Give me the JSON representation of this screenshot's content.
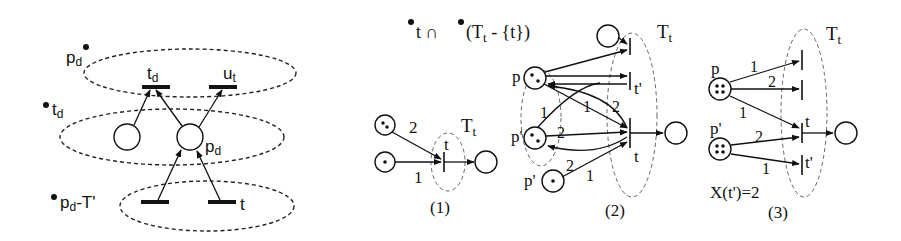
{
  "figure": {
    "left_panel": {
      "set_labels": {
        "pd_post": "p",
        "pd_post_sub": "d",
        "td_pre": "t",
        "td_pre_sub": "d",
        "pd_pre_minus": "p",
        "pd_pre_minus_sub": "d",
        "pd_pre_minus_rest": "-T'"
      },
      "transitions": {
        "td": "t",
        "td_sub": "d",
        "ut": "u",
        "ut_sub": "t",
        "t": "t"
      },
      "places": {
        "pd": "p",
        "pd_sub": "d"
      }
    },
    "header_formula": {
      "part1": "t ∩ ",
      "part2": "(T",
      "part2_sub": "t",
      "part3": " - {t})"
    },
    "panel1": {
      "caption": "(1)",
      "set_label": "T",
      "set_label_sub": "t",
      "transition_label": "t",
      "weights": [
        "2",
        "1"
      ]
    },
    "panel2": {
      "caption": "(2)",
      "set_label": "T",
      "set_label_sub": "t",
      "places": [
        "p",
        "p'",
        "p'"
      ],
      "transitions": [
        "t'",
        "t"
      ],
      "weights": [
        "1",
        "2",
        "1",
        "2",
        "2",
        "1"
      ]
    },
    "panel3": {
      "caption": "(3)",
      "set_label": "T",
      "set_label_sub": "t",
      "places": [
        "p",
        "p'"
      ],
      "transitions": [
        "t",
        "t'"
      ],
      "weights": [
        "1",
        "2",
        "1",
        "2",
        "1"
      ],
      "annotation": "X(t')=2"
    }
  }
}
